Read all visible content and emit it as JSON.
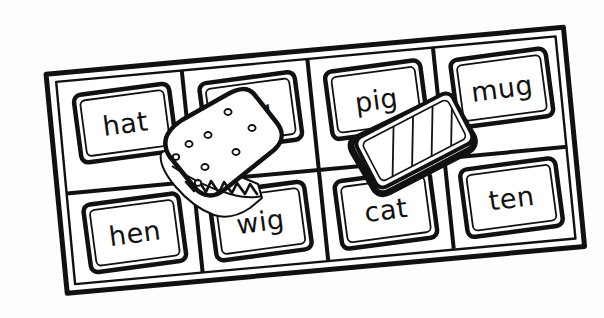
{
  "scene": {
    "title": "Word card grid board with two tiles placed on top",
    "background_color": "#fdfdfd",
    "ink_color": "#111111",
    "style": "black and white line drawing"
  },
  "board": {
    "name": "word-grid-board",
    "rows": 2,
    "columns": 4,
    "rotation_degrees": -7.5,
    "cells": [
      {
        "id": "cell-r1c1",
        "word": "hat",
        "row": 1,
        "column": 1,
        "occluded": false
      },
      {
        "id": "cell-r1c2",
        "word": "jug",
        "row": 1,
        "column": 2,
        "occluded": false
      },
      {
        "id": "cell-r1c3",
        "word": "pig",
        "row": 1,
        "column": 3,
        "occluded": true
      },
      {
        "id": "cell-r1c4",
        "word": "mug",
        "row": 1,
        "column": 4,
        "occluded": false
      },
      {
        "id": "cell-r2c1",
        "word": "hen",
        "row": 2,
        "column": 1,
        "occluded": false
      },
      {
        "id": "cell-r2c2",
        "word": "wig",
        "row": 2,
        "column": 2,
        "occluded": true
      },
      {
        "id": "cell-r2c3",
        "word": "cat",
        "row": 2,
        "column": 3,
        "occluded": false
      },
      {
        "id": "cell-r2c4",
        "word": "ten",
        "row": 2,
        "column": 4,
        "occluded": false
      }
    ]
  },
  "overlay_pieces": [
    {
      "id": "cracker-piece",
      "label": "cracker",
      "description": "rounded square cracker with small holes and a zigzag torn lower edge",
      "holes": 8,
      "rotation_degrees": -15,
      "covers_cells": [
        "cell-r2c2"
      ]
    },
    {
      "id": "striped-tile-piece",
      "label": "striped tile",
      "description": "rotated rectangular tile with thick black outline and diagonal stripes",
      "stripes": 4,
      "rotation_degrees": -27,
      "covers_cells": [
        "cell-r1c3"
      ]
    }
  ]
}
